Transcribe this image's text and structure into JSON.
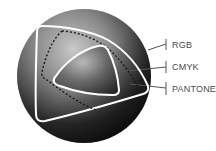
{
  "diagram": {
    "labels": [
      {
        "id": "rgb",
        "text": "RGB"
      },
      {
        "id": "cmyk",
        "text": "CMYK"
      },
      {
        "id": "pantone",
        "text": "PANTONE"
      }
    ],
    "colors": {
      "outline": "#ffffff",
      "dashed": "#1a1a1a",
      "leader": "#555555",
      "label_text": "#4a4a4a",
      "sphere_dark": "#0d0d0d",
      "sphere_light": "#d8d8d8"
    }
  }
}
